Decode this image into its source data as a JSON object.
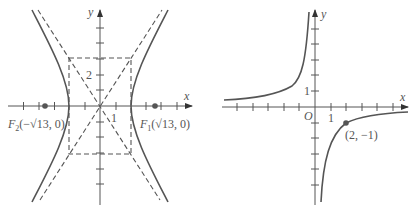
{
  "figures": [
    {
      "id": "hyperbola",
      "x_axis_label": "x",
      "y_axis_label": "y",
      "tick_label_x": "1",
      "tick_label_y": "2",
      "focus_left_label_F": "F",
      "focus_left_sub": "2",
      "focus_left_coords": "(−√13, 0)",
      "focus_right_label_F": "F",
      "focus_right_sub": "1",
      "focus_right_coords": "(√13, 0)",
      "point_color": "#555555"
    },
    {
      "id": "rectangular-hyperbola",
      "x_axis_label": "x",
      "y_axis_label": "y",
      "origin_label": "O",
      "tick_label_x": "1",
      "tick_label_y": "1",
      "point_label": "(2, −1)",
      "point_color": "#555555"
    }
  ]
}
